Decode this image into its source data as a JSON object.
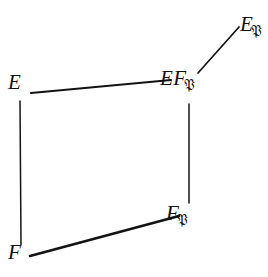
{
  "figure": {
    "width": 268,
    "height": 277,
    "background_color": "#ffffff",
    "ink_color": "#131313"
  },
  "nodes": [
    {
      "id": "E",
      "name": "node-E",
      "base": "E",
      "subscript": "",
      "x": 20,
      "y": 84
    },
    {
      "id": "F",
      "name": "node-F",
      "base": "F",
      "subscript": "",
      "x": 20,
      "y": 254
    },
    {
      "id": "EFP",
      "name": "node-EF-frak-P",
      "base": "EF",
      "subscript": "𝔓",
      "x": 180,
      "y": 80
    },
    {
      "id": "FP",
      "name": "node-F-frak-P",
      "base": "F",
      "subscript": "𝔓",
      "x": 186,
      "y": 215
    },
    {
      "id": "EP",
      "name": "node-E-frak-P",
      "base": "E",
      "subscript": "𝔓",
      "x": 252,
      "y": 26
    }
  ],
  "edges": [
    {
      "id": "E-EFP",
      "name": "edge-E-to-EF-frak-P",
      "from": "E",
      "to": "EFP",
      "x1": 31,
      "y1": 93,
      "x2": 171,
      "y2": 80
    },
    {
      "id": "E-F",
      "name": "edge-E-to-F",
      "from": "E",
      "to": "F",
      "x1": 20,
      "y1": 101,
      "x2": 21,
      "y2": 245
    },
    {
      "id": "EFP-FP",
      "name": "edge-EF-frak-P-to-F-frak-P",
      "from": "EFP",
      "to": "FP",
      "x1": 189,
      "y1": 104,
      "x2": 189,
      "y2": 203
    },
    {
      "id": "F-FP",
      "name": "edge-F-to-F-frak-P",
      "from": "F",
      "to": "FP",
      "x1": 30,
      "y1": 256,
      "x2": 179,
      "y2": 216
    },
    {
      "id": "EFP-EP",
      "name": "edge-EF-frak-P-to-E-frak-P",
      "from": "EFP",
      "to": "EP",
      "x1": 198,
      "y1": 73,
      "x2": 239,
      "y2": 27
    }
  ]
}
